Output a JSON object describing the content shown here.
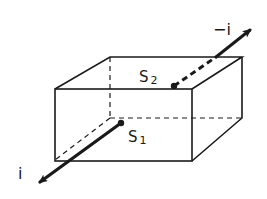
{
  "figure": {
    "labels": {
      "s1": {
        "main": "S",
        "sub": "1"
      },
      "s2": {
        "main": "S",
        "sub": "2"
      },
      "i": "i",
      "minus_i": "−i"
    },
    "colors": {
      "stroke": "#1a1a1a",
      "background": "#ffffff"
    }
  }
}
